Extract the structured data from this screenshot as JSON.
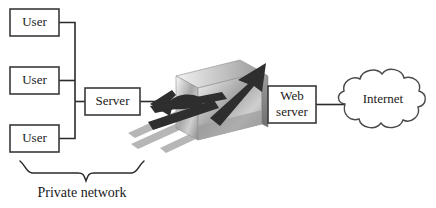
{
  "diagram": {
    "background_color": "#ffffff",
    "line_color": "#2b2b2b",
    "box_fill": "#ffffff",
    "box_stroke": "#3a3a3a",
    "wall_color_light": "#e8e8e8",
    "wall_color_mid": "#a8a8a8",
    "wall_color_dark": "#6e6e6e",
    "arrow_color": "#2e2e2e",
    "bar_color": "#b6b6b6"
  },
  "nodes": {
    "user_1": {
      "label": "User",
      "x": 10,
      "y": 9,
      "w": 49,
      "h": 27
    },
    "user_2": {
      "label": "User",
      "x": 10,
      "y": 67,
      "w": 49,
      "h": 27
    },
    "user_3": {
      "label": "User",
      "x": 10,
      "y": 125,
      "w": 49,
      "h": 27
    },
    "server": {
      "label": "Server",
      "x": 85,
      "y": 88,
      "w": 55,
      "h": 27
    },
    "web_server": {
      "label_line1": "Web",
      "label_line2": "server",
      "x": 268,
      "y": 86,
      "w": 48,
      "h": 37
    },
    "internet": {
      "label": "Internet",
      "cx": 383,
      "cy": 104
    }
  },
  "annotations": {
    "private_network": "Private network"
  },
  "firewall": {
    "name": "firewall-wall",
    "description": "3D gray slab wall pierced by arrows",
    "blocked_arrow": "blocked-traffic-arrow",
    "passing_arrow": "allowed-traffic-arrow"
  }
}
